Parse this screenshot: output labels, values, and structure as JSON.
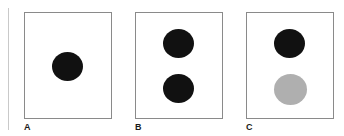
{
  "figure": {
    "background_color": "#ffffff",
    "panel_border_color": "#8a8a8a",
    "margin_rule_color": "#c9c9c9",
    "black": "#111111",
    "gray": "#afafaf"
  },
  "panels": [
    {
      "label": "A",
      "shapes": [
        {
          "name": "black-circle-center",
          "color": "#111111",
          "fill": "black"
        }
      ]
    },
    {
      "label": "B",
      "shapes": [
        {
          "name": "black-circle-top",
          "color": "#111111",
          "fill": "black"
        },
        {
          "name": "black-circle-bottom",
          "color": "#111111",
          "fill": "black"
        }
      ]
    },
    {
      "label": "C",
      "shapes": [
        {
          "name": "black-circle-top",
          "color": "#111111",
          "fill": "black"
        },
        {
          "name": "gray-circle-bottom",
          "color": "#afafaf",
          "fill": "gray"
        }
      ]
    }
  ]
}
